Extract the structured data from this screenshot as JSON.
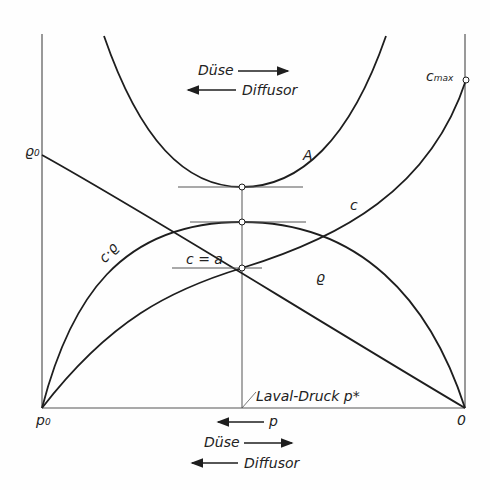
{
  "diagram": {
    "top_annotation": {
      "nozzle_label": "Düse",
      "diffuser_label": "Diffusor"
    },
    "bottom_annotation": {
      "pressure_label": "p",
      "nozzle_label": "Düse",
      "diffuser_label": "Diffusor"
    },
    "axis_labels": {
      "left_bottom": "p",
      "left_bottom_sub": "0",
      "right_bottom": "0",
      "left_top": "ϱ",
      "left_top_sub": "0",
      "right_top": "c",
      "right_top_sub": "max"
    },
    "curve_labels": {
      "area": "A",
      "velocity": "c",
      "mass_flux": "c·ϱ",
      "density": "ϱ",
      "sonic": "c = a"
    },
    "laval_label": "Laval-Druck p*",
    "colors": {
      "line": "#1e1e1e",
      "axis": "#555555",
      "background": "#fefefe"
    }
  }
}
